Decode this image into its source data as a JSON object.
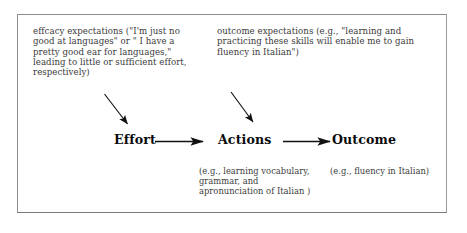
{
  "figure": {
    "background_color": "#ffffff",
    "frame_color": "#8d8d8d",
    "text_color": "#3b3b3b",
    "label_color": "#0b0b0b"
  },
  "notes": {
    "efficacy": "effcacy  expectations (\"I'm just no good at languages\" or \" I have a pretty good ear for languages,\" leading to little or sufficient effort, respectively)",
    "outcome": "outcome expectations  (e.g., \"learning and practicing these skills will enable me to gain fluency in Italian\")"
  },
  "flow": {
    "effort_label": "Effort",
    "actions_label": "Actions",
    "outcome_label": "Outcome"
  },
  "captions": {
    "actions": "(e.g., learning vocabulary, grammar, and apronunciation of Italian )",
    "outcome": "(e.g., fluency in Italian)"
  },
  "arrows": {
    "efficacy_to_effort": "diagonal-arrow-down-right",
    "outcome_to_actions": "diagonal-arrow-down-right",
    "effort_to_actions": "horizontal-arrow-right",
    "actions_to_outcome": "horizontal-arrow-right"
  }
}
